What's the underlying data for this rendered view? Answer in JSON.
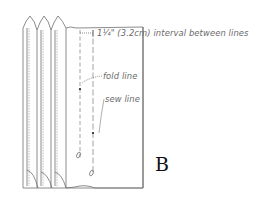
{
  "diagram": {
    "figure_label": "B",
    "labels": {
      "interval": "1¼\" (3.2cm) interval between lines",
      "fold_line": "fold line",
      "sew_line": "sew line"
    },
    "elements": {
      "stacked_pages": 3,
      "main_page": "folded page with fold line and sew line",
      "interval_measurement": "1¼\" (3.2cm)"
    },
    "colors": {
      "line": "#6f6f6f",
      "text": "#6a6a6a",
      "letter": "#111111",
      "background": "#ffffff"
    }
  }
}
